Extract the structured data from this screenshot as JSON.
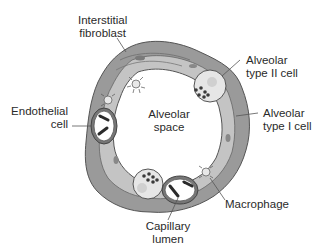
{
  "diagram": {
    "type": "anatomical",
    "colors": {
      "wall_outer": "#9a9a9a",
      "wall_inner": "#c4c4c4",
      "outline": "#555555",
      "cell_fill": "#e6e6e6",
      "chromosome": "#2b2b2b",
      "granule": "#3a3a3a",
      "background": "#ffffff"
    },
    "labels": {
      "interstitial_fibroblast": [
        "Interstitial",
        "fibroblast"
      ],
      "alveolar_type_ii": [
        "Alveolar",
        "type II cell"
      ],
      "alveolar_type_i": [
        "Alveolar",
        "type I cell"
      ],
      "endothelial": [
        "Endothelial",
        "cell"
      ],
      "alveolar_space": [
        "Alveolar",
        "space"
      ],
      "macrophage": [
        "Macrophage"
      ],
      "capillary_lumen": [
        "Capillary",
        "lumen"
      ]
    }
  }
}
